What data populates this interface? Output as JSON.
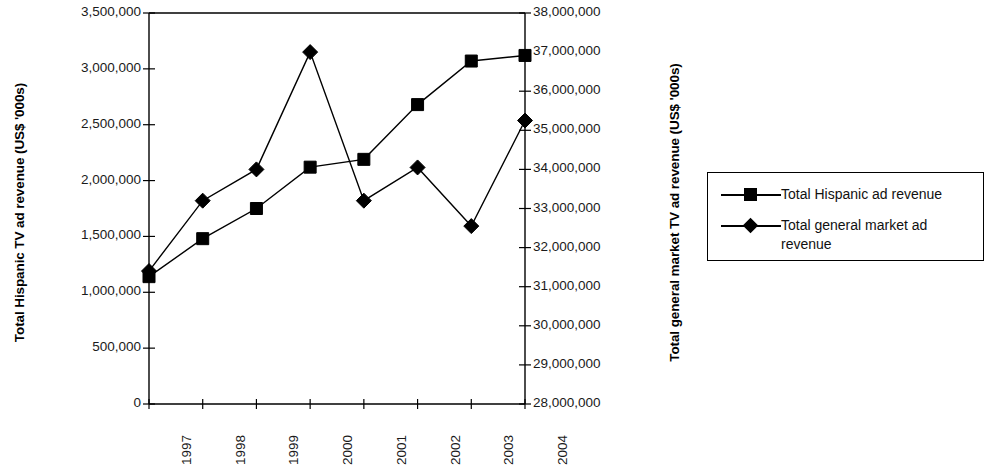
{
  "chart_data": {
    "type": "line",
    "title": "",
    "subtitle": "",
    "xlabel": "",
    "ylabel": "Total Hispanic TV ad revenue (US$ '000s)",
    "y2label": "Total general market TV ad revenue (US$ '000s)",
    "categories": [
      "1997",
      "1998",
      "1999",
      "2000",
      "2001",
      "2002",
      "2003",
      "2004"
    ],
    "ylim": [
      0,
      3500000
    ],
    "y2lim": [
      28000000,
      38000000
    ],
    "ytick_labels": [
      "3,500,000",
      "3,000,000",
      "2,500,000",
      "2,000,000",
      "1,500,000",
      "1,000,000",
      "500,000",
      "0"
    ],
    "ytick_values": [
      3500000,
      3000000,
      2500000,
      2000000,
      1500000,
      1000000,
      500000,
      0
    ],
    "y2tick_labels": [
      "38,000,000",
      "37,000,000",
      "36,000,000",
      "35,000,000",
      "34,000,000",
      "33,000,000",
      "32,000,000",
      "31,000,000",
      "30,000,000",
      "29,000,000",
      "28,000,000"
    ],
    "y2tick_values": [
      38000000,
      37000000,
      36000000,
      35000000,
      34000000,
      33000000,
      32000000,
      31000000,
      30000000,
      29000000,
      28000000
    ],
    "grid": false,
    "legend_position": "right",
    "series": [
      {
        "name": "Total Hispanic ad revenue",
        "axis": "left",
        "marker": "square",
        "color": "#000000",
        "values": [
          1140000,
          1480000,
          1750000,
          2120000,
          2190000,
          2680000,
          3070000,
          3120000
        ]
      },
      {
        "name": "Total general market ad revenue",
        "axis": "right",
        "marker": "diamond",
        "color": "#000000",
        "values": [
          31400000,
          33200000,
          34000000,
          37000000,
          33200000,
          34050000,
          32550000,
          35250000
        ]
      }
    ]
  },
  "legend": {
    "entries": [
      {
        "label": "Total Hispanic ad revenue",
        "marker": "square-marker-icon"
      },
      {
        "label": "Total general market ad revenue",
        "marker": "diamond-marker-icon"
      }
    ]
  }
}
